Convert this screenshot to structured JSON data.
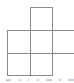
{
  "diagram": {
    "line_color": "#8a8a8a",
    "cells": [
      {
        "row": 0,
        "col": 1
      },
      {
        "row": 1,
        "col": 0
      },
      {
        "row": 1,
        "col": 1
      },
      {
        "row": 1,
        "col": 2
      },
      {
        "row": 2,
        "col": 0
      },
      {
        "row": 2,
        "col": 1
      }
    ],
    "bottom_labels": [
      "abc",
      "b",
      "c",
      "lo",
      "bbb",
      "b",
      "bbb"
    ],
    "side_mark": "'"
  }
}
